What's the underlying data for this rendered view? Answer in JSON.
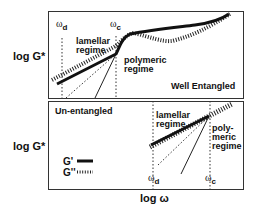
{
  "figure": {
    "y_axis_label": "log G*",
    "x_axis_label": "log ω",
    "top_panel": {
      "title": "Well Entangled",
      "omega_d": {
        "symbol": "ω",
        "sub": "d"
      },
      "omega_c": {
        "symbol": "ω",
        "sub": "c"
      },
      "region_left": "lamellar\nregime",
      "region_right": "polymeric\nregime"
    },
    "bottom_panel": {
      "title": "Un-entangled",
      "omega_d": {
        "symbol": "ω",
        "sub": "d"
      },
      "omega_c": {
        "symbol": "ω",
        "sub": "c"
      },
      "region_left": "lamellar\nregime",
      "region_right": "poly-\nmeric\nregime",
      "legend": [
        {
          "label": "G'",
          "style": "solid-thick"
        },
        {
          "label": "G''",
          "style": "hatched"
        }
      ]
    },
    "colors": {
      "line": "#111111",
      "axis": "#333333",
      "background": "#ffffff"
    }
  }
}
